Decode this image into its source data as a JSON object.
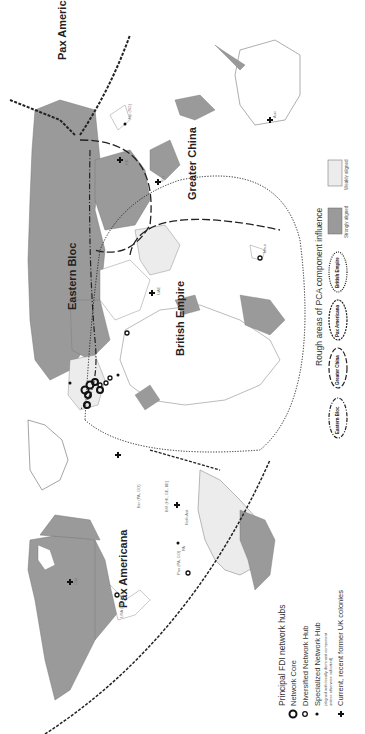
{
  "map": {
    "orientation": "rotated 90 degrees counter-clockwise",
    "colors": {
      "strongly_aligned": "#9a9a9a",
      "weakly_aligned": "#ececec",
      "unaligned": "#ffffff",
      "borders": "#6e6e6e",
      "markers": "#111111"
    },
    "regions": [
      {
        "label": "Pax Americana",
        "id": "pax-americana-west"
      },
      {
        "label": "Pax Americana",
        "id": "pax-americana-east"
      },
      {
        "label": "Eastern Bloc",
        "id": "eastern-bloc"
      },
      {
        "label": "British Empire",
        "id": "british-empire"
      },
      {
        "label": "Greater China",
        "id": "greater-china"
      }
    ],
    "hub_labels": [
      {
        "text": "USA (FR, GE)"
      },
      {
        "text": "Ber (PA, GO)"
      },
      {
        "text": "BVI (HK, GE, BE)"
      },
      {
        "text": "Neth Ant"
      },
      {
        "text": "PA"
      },
      {
        "text": "Pan (PA, GO)"
      },
      {
        "text": "UAE"
      },
      {
        "text": "Maur"
      },
      {
        "text": "HK"
      },
      {
        "text": "Sin"
      },
      {
        "text": "Jap (SG)"
      },
      {
        "text": "Aus"
      },
      {
        "text": "Can"
      }
    ]
  },
  "legend_hubs": {
    "title": "Principal FDI network hubs",
    "items": [
      {
        "icon": "network-core-icon",
        "label": "Network Core"
      },
      {
        "icon": "diversified-hub-icon",
        "label": "Diversified Network Hub"
      },
      {
        "icon": "specialized-hub-icon",
        "label": "Specialized Network Hub"
      },
      {
        "icon": "uk-colony-cross-icon",
        "label": "Current, recent former UK colonies"
      }
    ],
    "note_line1": "(aligned with locally dominant component",
    "note_line2": "unless otherwise indicated)"
  },
  "legend_pca": {
    "title": "Rough areas of PCA component influence",
    "ovals": [
      {
        "label": "Eastern Bloc",
        "style": "dash-dot"
      },
      {
        "label": "Greater China",
        "style": "long-dash"
      },
      {
        "label": "Pax Americana",
        "style": "double-dash"
      },
      {
        "label": "British Empire",
        "style": "dotted"
      }
    ],
    "swatches": [
      {
        "label": "Strongly aligned",
        "color": "#9a9a9a"
      },
      {
        "label": "Weakly aligned",
        "color": "#ececec"
      }
    ]
  }
}
